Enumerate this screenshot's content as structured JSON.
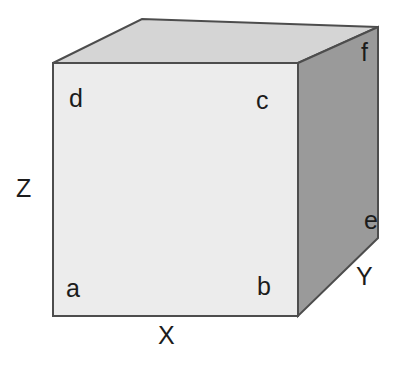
{
  "figure": {
    "background_color": "#ffffff",
    "width": 403,
    "height": 369
  },
  "cube": {
    "faces": {
      "front": {
        "name": "front-face",
        "fill": "#ececec",
        "stroke": "#4d4d4d",
        "points": "53,63 298,63 298,316 53,316"
      },
      "top": {
        "name": "top-face",
        "fill": "#d5d5d5",
        "stroke": "#4d4d4d",
        "points": "53,63 142,19 378,27 298,63"
      },
      "right": {
        "name": "right-face",
        "fill": "#9a9a9a",
        "stroke": "#4d4d4d",
        "points": "298,63 378,27 378,238 298,316"
      }
    },
    "stroke_width": 2
  },
  "vertex_labels": [
    {
      "id": "d",
      "text": "d",
      "x": 69,
      "y": 86
    },
    {
      "id": "c",
      "text": "c",
      "x": 256,
      "y": 88
    },
    {
      "id": "a",
      "text": "a",
      "x": 66,
      "y": 276
    },
    {
      "id": "b",
      "text": "b",
      "x": 257,
      "y": 274
    },
    {
      "id": "f",
      "text": "f",
      "x": 361,
      "y": 40
    },
    {
      "id": "e",
      "text": "e",
      "x": 364,
      "y": 208
    }
  ],
  "axis_labels": [
    {
      "id": "z",
      "text": "Z",
      "x": 16,
      "y": 176,
      "meaning": "vertical-axis"
    },
    {
      "id": "x",
      "text": "X",
      "x": 158,
      "y": 323,
      "meaning": "horizontal-axis"
    },
    {
      "id": "y",
      "text": "Y",
      "x": 356,
      "y": 264,
      "meaning": "depth-axis"
    }
  ],
  "colors": {
    "front_face": "#ececec",
    "top_face": "#d5d5d5",
    "right_face": "#9a9a9a",
    "edge_stroke": "#4d4d4d",
    "text": "#1c1c1c",
    "background": "#ffffff"
  }
}
